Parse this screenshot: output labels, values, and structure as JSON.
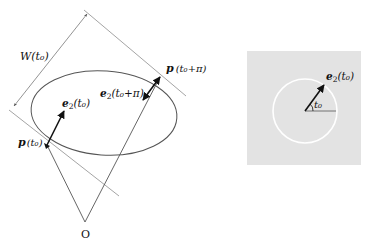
{
  "left_diagram": {
    "width_label": "W(t₀)",
    "p_t0_label": "p",
    "p_t0_arg": "(t₀)",
    "p_t0pi_label": "p",
    "p_t0pi_arg": "(t₀+π)",
    "e2_t0_label": "e",
    "e2_t0_sub": "2",
    "e2_t0_arg": "(t₀)",
    "e2_t0pi_label": "e",
    "e2_t0pi_sub": "2",
    "e2_t0pi_arg": "(t₀+π)",
    "origin_label": "O"
  },
  "right_diagram": {
    "e2_label": "e",
    "e2_sub": "2",
    "e2_arg": "(t₀)",
    "angle_label": "t₀",
    "background_color": "#e3e3e3",
    "circle_color": "#ffffff"
  },
  "colors": {
    "curve": "#555555",
    "tangent": "#999999",
    "vector": "#111111"
  }
}
